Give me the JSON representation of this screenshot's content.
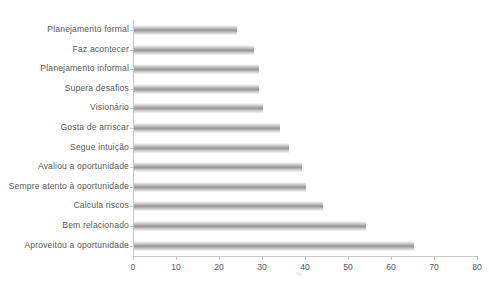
{
  "chart_data": {
    "type": "bar",
    "orientation": "horizontal",
    "title": "",
    "caption": "",
    "xlabel": "%",
    "ylabel": "",
    "xlim": [
      0,
      80
    ],
    "xticks": [
      0,
      10,
      20,
      30,
      40,
      50,
      60,
      70,
      80
    ],
    "grid": false,
    "legend": null,
    "bar_color": "#a0a0a0",
    "axis_color": "#c8c8c8",
    "text_color": "#5a5a5a",
    "categories": [
      "Planejamento formal",
      "Faz acontecer",
      "Planejamento informal",
      "Supera desafios",
      "Visionário",
      "Gosta de arriscar",
      "Segue intuição",
      "Avaliou a oportunidade",
      "Sempre atento à oportunidade",
      "Calcula riscos",
      "Bem relacionado",
      "Aproveitou a oportunidade"
    ],
    "values": [
      24,
      28,
      29,
      29,
      30,
      34,
      36,
      39,
      40,
      44,
      54,
      65
    ]
  }
}
